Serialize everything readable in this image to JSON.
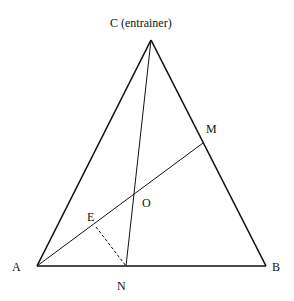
{
  "diagram": {
    "type": "geometry-triangle",
    "points": {
      "A": {
        "label": "A",
        "x": 37,
        "y": 266
      },
      "B": {
        "label": "B",
        "x": 266,
        "y": 266
      },
      "C": {
        "label": "C (entrainer)",
        "x": 151,
        "y": 40
      },
      "M": {
        "label": "M",
        "x": 203,
        "y": 143
      },
      "N": {
        "label": "N",
        "x": 126,
        "y": 266
      },
      "O": {
        "label": "O",
        "x": 134,
        "y": 194
      },
      "E": {
        "label": "E",
        "x": 96,
        "y": 227
      }
    },
    "segments": [
      {
        "from": "A",
        "to": "B",
        "style": "solid"
      },
      {
        "from": "B",
        "to": "C",
        "style": "solid"
      },
      {
        "from": "C",
        "to": "A",
        "style": "solid"
      },
      {
        "from": "A",
        "to": "M",
        "style": "solid"
      },
      {
        "from": "C",
        "to": "N",
        "style": "solid"
      },
      {
        "from": "E",
        "to": "N",
        "style": "dashed"
      }
    ],
    "colors": {
      "line": "#111111",
      "background": "#ffffff"
    }
  }
}
